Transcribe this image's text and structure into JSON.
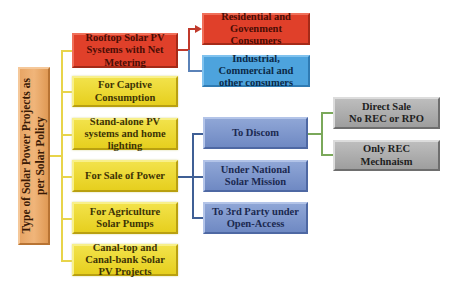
{
  "diagram": {
    "root": {
      "label_line1": "Type of Solar Power Projects as",
      "label_line2": "per Solar Policy",
      "color": "#ec a96e"
    },
    "categories": [
      {
        "label": "Rooftop Solar PV Systems with Net Metering",
        "color": "#e0402a"
      },
      {
        "label": "For Captive Consumption",
        "color": "#ecd630"
      },
      {
        "label": "Stand-alone PV systems and home lighting",
        "color": "#ecd630"
      },
      {
        "label": "For Sale of Power",
        "color": "#ecd630"
      },
      {
        "label": "For Agriculture Solar Pumps",
        "color": "#ecd630"
      },
      {
        "label": "Canal-top and Canal-bank Solar PV Projects",
        "color": "#ecd630"
      }
    ],
    "rooftop_children": [
      {
        "label": "Residential and Govenment Consumers",
        "color": "#e0402a"
      },
      {
        "label": "Industrial, Commercial and other consumers",
        "color": "#4da3dd"
      }
    ],
    "sale_children": [
      {
        "label": "To Discom",
        "color": "#7f97cc"
      },
      {
        "label": "Under National Solar Mission",
        "color": "#7f97cc"
      },
      {
        "label": "To 3rd Party under Open-Access",
        "color": "#7f97cc"
      }
    ],
    "discom_children": [
      {
        "label": "Direct Sale No REC or RPO",
        "line1": "Direct Sale",
        "line2": "No REC or RPO",
        "color": "#aeaeae"
      },
      {
        "label": "Only REC Mechnaism",
        "color": "#aeaeae"
      }
    ]
  }
}
